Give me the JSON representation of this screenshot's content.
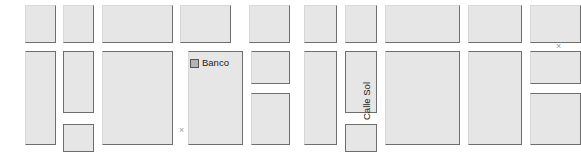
{
  "panels": [
    {
      "name": "left-map-panel",
      "blocks": [
        {
          "x": 25,
          "y": 5,
          "w": 31,
          "h": 38,
          "edges": "rb"
        },
        {
          "x": 63,
          "y": 5,
          "w": 31,
          "h": 38,
          "edges": "rb"
        },
        {
          "x": 102,
          "y": 5,
          "w": 71,
          "h": 38,
          "edges": "rb"
        },
        {
          "x": 180,
          "y": 5,
          "w": 51,
          "h": 38,
          "edges": "rb"
        },
        {
          "x": 249,
          "y": 5,
          "w": 41,
          "h": 38,
          "edges": "rb"
        },
        {
          "x": 25,
          "y": 51,
          "w": 31,
          "h": 94,
          "edges": "trb"
        },
        {
          "x": 63,
          "y": 51,
          "w": 31,
          "h": 62,
          "edges": "trbl"
        },
        {
          "x": 63,
          "y": 124,
          "w": 31,
          "h": 28,
          "edges": "trbl"
        },
        {
          "x": 102,
          "y": 51,
          "w": 71,
          "h": 94,
          "edges": "trb"
        },
        {
          "x": 188,
          "y": 51,
          "w": 55,
          "h": 94,
          "edges": "trb"
        },
        {
          "x": 251,
          "y": 51,
          "w": 39,
          "h": 33,
          "edges": "trb"
        },
        {
          "x": 251,
          "y": 93,
          "w": 39,
          "h": 52,
          "edges": "trb"
        }
      ],
      "pois": [
        {
          "name": "banco",
          "label": "Banco",
          "x": 190,
          "y": 58,
          "swatch_color": "#b4b4b4"
        }
      ],
      "street_labels": [],
      "x_markers": [
        {
          "x": 179,
          "y": 126,
          "glyph": "×"
        }
      ]
    },
    {
      "name": "right-map-panel",
      "blocks": [
        {
          "x": 13,
          "y": 5,
          "w": 33,
          "h": 38,
          "edges": "rb"
        },
        {
          "x": 54,
          "y": 5,
          "w": 32,
          "h": 38,
          "edges": "rb"
        },
        {
          "x": 94,
          "y": 5,
          "w": 75,
          "h": 38,
          "edges": "rb"
        },
        {
          "x": 177,
          "y": 5,
          "w": 54,
          "h": 38,
          "edges": "rb"
        },
        {
          "x": 239,
          "y": 5,
          "w": 51,
          "h": 38,
          "edges": "rb"
        },
        {
          "x": 13,
          "y": 51,
          "w": 33,
          "h": 94,
          "edges": "trb"
        },
        {
          "x": 54,
          "y": 51,
          "w": 32,
          "h": 62,
          "edges": "trbl"
        },
        {
          "x": 54,
          "y": 124,
          "w": 32,
          "h": 28,
          "edges": "trbl"
        },
        {
          "x": 94,
          "y": 51,
          "w": 75,
          "h": 94,
          "edges": "trb"
        },
        {
          "x": 177,
          "y": 51,
          "w": 54,
          "h": 94,
          "edges": "trb"
        },
        {
          "x": 239,
          "y": 51,
          "w": 51,
          "h": 33,
          "edges": "trb"
        },
        {
          "x": 239,
          "y": 93,
          "w": 51,
          "h": 52,
          "edges": "trb"
        }
      ],
      "pois": [],
      "street_labels": [
        {
          "name": "calle-sol",
          "label": "Calle Sol",
          "x": 81,
          "y": 110
        }
      ],
      "x_markers": [
        {
          "x": 265,
          "y": 42,
          "glyph": "×"
        }
      ]
    }
  ],
  "theme": {
    "background": "#ffffff",
    "block_fill": "#e6e6e6",
    "block_edge": "#6e6e6e",
    "label_text": "#1c1c1c",
    "marker_text": "#9a9a9a"
  }
}
